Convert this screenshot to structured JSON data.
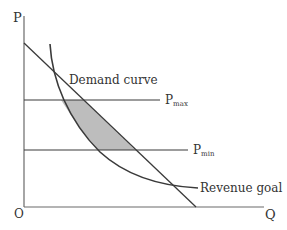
{
  "diagram": {
    "title": "",
    "axes": {
      "y_label": "P",
      "x_label": "Q",
      "origin_label": "O"
    },
    "curves": {
      "demand_label": "Demand curve",
      "revenue_label": "Revenue goal"
    },
    "price_lines": {
      "max": {
        "base": "P",
        "sub": "max"
      },
      "min": {
        "base": "P",
        "sub": "min"
      }
    },
    "colors": {
      "line": "#3a3a3a",
      "shade": "#bdbdbd",
      "text": "#333333"
    }
  }
}
